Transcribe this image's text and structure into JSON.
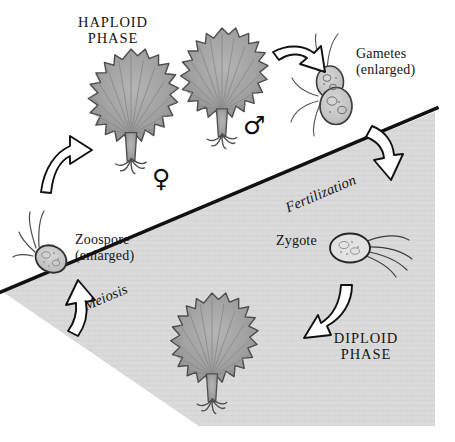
{
  "figure": {
    "background_color": "#ffffff",
    "diploid_region_color": "#d9d9d9",
    "boundary_color": "#111111",
    "thallus_fill": "#a3a3a3",
    "thallus_stroke": "#4d4d4d",
    "arrow_fill": "#ffffff",
    "arrow_stroke": "#111111"
  },
  "labels": {
    "haploid_phase_line1": "HAPLOID",
    "haploid_phase_line2": "PHASE",
    "diploid_phase_line1": "DIPLOID",
    "diploid_phase_line2": "PHASE",
    "gametes_line1": "Gametes",
    "gametes_line2": "(enlarged)",
    "zoospore_line1": "Zoospore",
    "zoospore_line2": "(enlarged)",
    "zygote": "Zygote",
    "fertilization": "Fertilization",
    "meiosis": "Meiosis",
    "female_symbol": "♀",
    "male_symbol": "♂"
  },
  "structures": [
    {
      "name": "female-thallus",
      "label": "female gametophyte thallus",
      "phase": "haploid"
    },
    {
      "name": "male-thallus",
      "label": "male gametophyte thallus",
      "phase": "haploid"
    },
    {
      "name": "gametes",
      "label": "fusing gametes",
      "phase": "haploid"
    },
    {
      "name": "zygote",
      "label": "zygote",
      "phase": "diploid"
    },
    {
      "name": "sporophyte-thallus",
      "label": "sporophyte thallus",
      "phase": "diploid"
    },
    {
      "name": "zoospore",
      "label": "zoospore",
      "phase": "haploid"
    }
  ],
  "arrows": [
    {
      "name": "gamete-release-arrow",
      "from": "male-thallus",
      "to": "gametes"
    },
    {
      "name": "fertilization-arrow",
      "from": "gametes",
      "to": "zygote",
      "process": "Fertilization"
    },
    {
      "name": "zygote-to-sporophyte-arrow",
      "from": "zygote",
      "to": "sporophyte-thallus"
    },
    {
      "name": "meiosis-arrow",
      "from": "sporophyte-thallus",
      "to": "zoospore",
      "process": "Meiosis"
    },
    {
      "name": "zoospore-to-gametophyte-arrow",
      "from": "zoospore",
      "to": "female-thallus"
    }
  ]
}
